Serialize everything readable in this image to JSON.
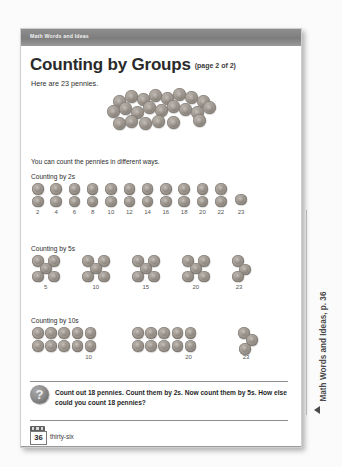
{
  "banner": {
    "label": "Math Words and Ideas"
  },
  "title": {
    "main": "Counting by Groups",
    "page_of": "(page 2 of 2)"
  },
  "intro": {
    "pennies_line": "Here are 23 pennies.",
    "ways_line": "You can count the pennies in different ways."
  },
  "sections": [
    {
      "heading": "Counting by 2s",
      "group_size": 2,
      "groups": 11,
      "remainder": 1,
      "labels": [
        "2",
        "4",
        "6",
        "8",
        "10",
        "12",
        "14",
        "16",
        "18",
        "20",
        "22",
        "23"
      ]
    },
    {
      "heading": "Counting by 5s",
      "group_size": 5,
      "groups": 4,
      "remainder": 3,
      "labels": [
        "5",
        "10",
        "15",
        "20",
        "23"
      ]
    },
    {
      "heading": "Counting by 10s",
      "group_size": 10,
      "groups": 2,
      "remainder": 3,
      "labels": [
        "10",
        "20",
        "23"
      ]
    }
  ],
  "question": {
    "icon": "question-mark-icon",
    "text": "Count out 18 pennies. Count them by 2s. Now count them by 5s. How else could you count 18 pennies?"
  },
  "footer": {
    "page_number": "36",
    "page_word": "thirty-six"
  },
  "side_tab": {
    "text": "Math Words and Ideas, p. 36",
    "marker": "triangle-left-icon"
  },
  "colors": {
    "banner": "#7d7d7d",
    "penny": "#a39c94",
    "rule": "#8d8d8d",
    "text": "#2d2d2d"
  }
}
